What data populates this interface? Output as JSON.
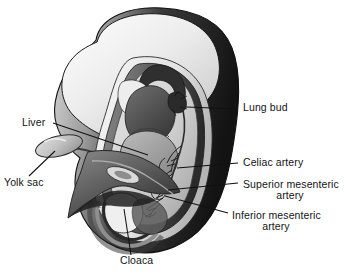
{
  "figure": {
    "background_color": "#ffffff",
    "signature": "a.b.R."
  },
  "labels": [
    {
      "id": "lung-bud",
      "text": "Lung bud",
      "text2": "",
      "x": 243,
      "y": 111,
      "anchor": "start"
    },
    {
      "id": "celiac-artery",
      "text": "Celiac artery",
      "text2": "",
      "x": 243,
      "y": 166,
      "anchor": "start"
    },
    {
      "id": "superior-mesenteric",
      "text": "Superior mesenteric",
      "text2": "artery",
      "x": 243,
      "y": 188,
      "anchor": "start"
    },
    {
      "id": "inferior-mesenteric",
      "text": "Inferior mesenteric",
      "text2": "artery",
      "x": 232,
      "y": 219,
      "anchor": "start"
    },
    {
      "id": "liver",
      "text": "Liver",
      "text2": "",
      "x": 22,
      "y": 126,
      "anchor": "start"
    },
    {
      "id": "yolk-sac",
      "text": "Yolk sac",
      "text2": "",
      "x": 4,
      "y": 186,
      "anchor": "start"
    },
    {
      "id": "cloaca",
      "text": "Cloaca",
      "text2": "",
      "x": 120,
      "y": 264,
      "anchor": "start"
    }
  ],
  "leaders": [
    {
      "id": "leader-lung-bud",
      "d": "M 238 109 L 186 107"
    },
    {
      "id": "leader-celiac-artery",
      "d": "M 238 163 L 177 168"
    },
    {
      "id": "leader-superior-mesenteric",
      "d": "M 238 183 L 168 190"
    },
    {
      "id": "leader-inferior-mesenteric",
      "d": "M 228 213 L 165 196"
    },
    {
      "id": "leader-liver",
      "d": "M 53 123 L 148 155"
    },
    {
      "id": "leader-yolk-sac",
      "d": "M 29 176 L 55 151"
    },
    {
      "id": "leader-cloaca",
      "d": "M 131 255 L 124 209"
    }
  ],
  "colors": {
    "outline": "#111111",
    "shell_dark": "#1b1b1b",
    "shell_mid": "#5a5a5a",
    "shell_light": "#f2f2f2",
    "head_light": "#e8e8e8",
    "liver": "#9c9c9c",
    "heart_dark": "#4c4c4c",
    "yolk_sac": "#bdbdbd",
    "gut_cavity": "#cfcfcf",
    "membrane": "#5e5e5e",
    "text": "#141414"
  }
}
